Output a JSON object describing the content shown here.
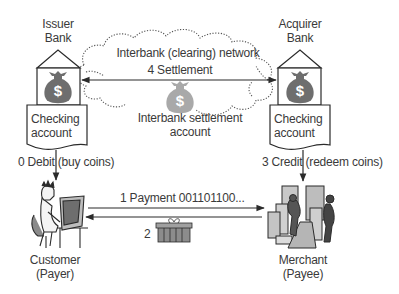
{
  "diagram": {
    "title": "",
    "issuer_bank": {
      "label": "Issuer\nBank",
      "account_label": "Checking\naccount"
    },
    "acquirer_bank": {
      "label": "Acquirer\nBank",
      "account_label": "Checking\naccount"
    },
    "network": {
      "label": "Interbank (clearing) network",
      "settlement_step": "4 Settlement",
      "settlement_account_label": "Interbank settlement\naccount"
    },
    "customer": {
      "label": "Customer\n(Payer)"
    },
    "merchant": {
      "label": "Merchant\n(Payee)"
    },
    "steps": {
      "debit": {
        "number": "0",
        "label": "0 Debit (buy coins)"
      },
      "payment": {
        "number": "1",
        "label": "1 Payment 001101100..."
      },
      "goods": {
        "number": "2",
        "label": "2"
      },
      "credit": {
        "number": "3",
        "label": "3 Credit (redeem coins)"
      },
      "settlement": {
        "number": "4",
        "label": "4 Settlement"
      }
    },
    "icons": {
      "bank_money_bag": "money-bag-dollar",
      "settlement_money_bag": "money-bag-dollar",
      "customer": "person-at-computer",
      "merchant": "merchant-shop",
      "goods": "gift-box"
    },
    "colors": {
      "line": "#2b2b2b",
      "text": "#3a3a3a",
      "bag_dark": "#6e6e6e",
      "bag_light": "#a9a9a9",
      "cloud_dots": "#555555"
    }
  }
}
